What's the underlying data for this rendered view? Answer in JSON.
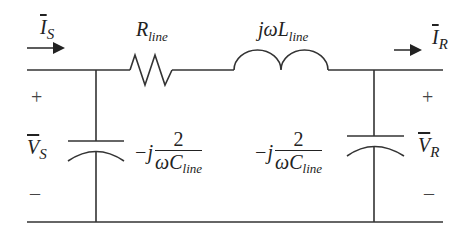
{
  "diagram": {
    "type": "pi-equivalent transmission line circuit",
    "colors": {
      "wire": "#333333",
      "text": "#222222"
    },
    "labels": {
      "is": {
        "base": "I",
        "sub": "S",
        "overbar": true
      },
      "ir": {
        "base": "I",
        "sub": "R",
        "overbar": true
      },
      "vs": {
        "base": "V",
        "sub": "S",
        "overbar": true
      },
      "vr": {
        "base": "V",
        "sub": "R",
        "overbar": true
      },
      "resistor": {
        "base": "R",
        "sub": "line"
      },
      "inductor": {
        "prefix": "jω",
        "base": "L",
        "sub": "line"
      },
      "cap_left": {
        "prefix": "−j",
        "num": "2",
        "den_base": "ωC",
        "den_sub": "line"
      },
      "cap_right": {
        "prefix": "−j",
        "num": "2",
        "den_base": "ωC",
        "den_sub": "line"
      },
      "plus_left": "+",
      "minus_left": "–",
      "plus_right": "+",
      "minus_right": "–"
    },
    "components": [
      {
        "id": "resistor",
        "kind": "resistor",
        "label_ref": "resistor"
      },
      {
        "id": "inductor",
        "kind": "inductor",
        "label_ref": "inductor"
      },
      {
        "id": "cap_left",
        "kind": "capacitor",
        "label_ref": "cap_left"
      },
      {
        "id": "cap_right",
        "kind": "capacitor",
        "label_ref": "cap_right"
      }
    ]
  }
}
